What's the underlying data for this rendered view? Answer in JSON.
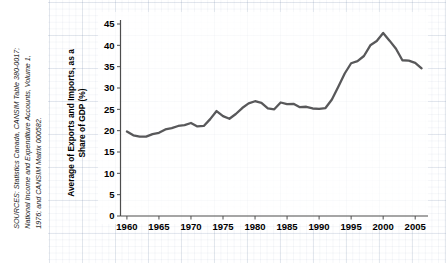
{
  "sources": {
    "lead": "SOURCES:",
    "text": "SOURCES: Statistics Canada, CANSIM Table 380-0017;\nNational Income and Expenditure Accounts, Volume 1,\n1976; and CANSIM Matrix 000582."
  },
  "colors": {
    "line": "#58585a",
    "axis": "#4d4d4d",
    "text": "#000000",
    "grid": "#c9d2e0",
    "background": "#ffffff"
  },
  "chart_data": {
    "type": "line",
    "title": "",
    "xlabel": "",
    "ylabel": "Average of Exports and Imports,\nas a Share of GDP (%)",
    "xlim": [
      1959,
      2007
    ],
    "ylim": [
      0,
      45
    ],
    "y_ticks": [
      0,
      5,
      10,
      15,
      20,
      25,
      30,
      35,
      40,
      45
    ],
    "x_ticks": [
      1960,
      1965,
      1970,
      1975,
      1980,
      1985,
      1990,
      1995,
      2000,
      2005
    ],
    "y_tick_labels": [
      "0",
      "5",
      "10",
      "15",
      "20",
      "25",
      "30",
      "35",
      "40",
      "45"
    ],
    "x_tick_labels": [
      "1960",
      "1965",
      "1970",
      "1975",
      "1980",
      "1985",
      "1990",
      "1995",
      "2000",
      "2005"
    ],
    "grid": false,
    "legend": null,
    "series": [
      {
        "name": "Average of Exports and Imports as a Share of GDP",
        "x": [
          1960,
          1961,
          1962,
          1963,
          1964,
          1965,
          1966,
          1967,
          1968,
          1969,
          1970,
          1971,
          1972,
          1973,
          1974,
          1975,
          1976,
          1977,
          1978,
          1979,
          1980,
          1981,
          1982,
          1983,
          1984,
          1985,
          1986,
          1987,
          1988,
          1989,
          1990,
          1991,
          1992,
          1993,
          1994,
          1995,
          1996,
          1997,
          1998,
          1999,
          2000,
          2001,
          2002,
          2003,
          2004,
          2005,
          2006
        ],
        "values": [
          19.8,
          18.9,
          18.6,
          18.6,
          19.2,
          19.5,
          20.3,
          20.6,
          21.1,
          21.3,
          21.8,
          21.0,
          21.1,
          22.7,
          24.6,
          23.4,
          22.8,
          23.9,
          25.3,
          26.4,
          26.9,
          26.5,
          25.2,
          25.0,
          26.6,
          26.2,
          26.3,
          25.5,
          25.6,
          25.2,
          25.1,
          25.3,
          27.3,
          30.3,
          33.4,
          35.8,
          36.3,
          37.5,
          40.0,
          41.0,
          42.9,
          41.1,
          39.2,
          36.5,
          36.4,
          35.9,
          34.6
        ]
      }
    ]
  }
}
